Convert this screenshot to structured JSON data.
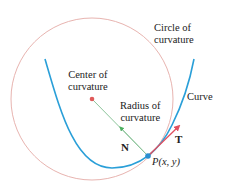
{
  "colors": {
    "circle": "#e8b4b0",
    "curve": "#2a9fd8",
    "normal_arrow": "#8cc49a",
    "normal_head": "#4caf60",
    "tangent_arrow": "#e05060",
    "center_dot": "#e05a5a",
    "point": "#2a8fd0"
  },
  "labels": {
    "circle_of_curvature": [
      "Circle of",
      "curvature"
    ],
    "center_of_curvature": [
      "Center of",
      "curvature"
    ],
    "radius_of_curvature": [
      "Radius of",
      "curvature"
    ],
    "curve": "Curve",
    "tangent_vector": "T",
    "normal_vector": "N",
    "point": "P(x, y)"
  }
}
